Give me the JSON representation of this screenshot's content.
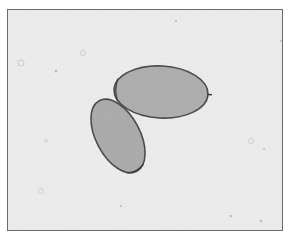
{
  "image": {
    "description": "Grayscale micrograph of two oval eggs on a speckled background",
    "colors": {
      "background": "#e6e6e6",
      "egg_fill": "#a9a9a9",
      "egg_outline": "#4a4a4a",
      "frame_border": "#6b6b6b"
    },
    "objects": [
      {
        "name": "egg-upper-right",
        "cx": 160,
        "cy": 91,
        "rx": 47,
        "ry": 26,
        "rotation": 3
      },
      {
        "name": "egg-lower-left",
        "cx": 117,
        "cy": 135,
        "rx": 40,
        "ry": 22,
        "rotation": 62
      }
    ]
  }
}
